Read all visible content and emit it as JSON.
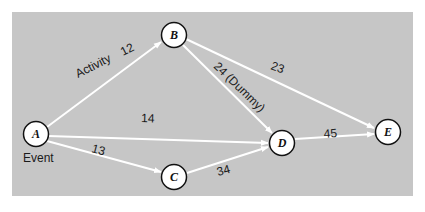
{
  "diagram": {
    "type": "network",
    "background": "#c6c6c6",
    "edge_color": "#ffffff",
    "nodes": [
      {
        "id": "A",
        "label": "A",
        "x": 36,
        "y": 134
      },
      {
        "id": "B",
        "label": "B",
        "x": 174,
        "y": 35
      },
      {
        "id": "C",
        "label": "C",
        "x": 174,
        "y": 177
      },
      {
        "id": "D",
        "label": "D",
        "x": 282,
        "y": 143
      },
      {
        "id": "E",
        "label": "E",
        "x": 388,
        "y": 132
      }
    ],
    "edges": [
      {
        "from": "A",
        "to": "B",
        "label": "12"
      },
      {
        "from": "A",
        "to": "D",
        "label": "14"
      },
      {
        "from": "A",
        "to": "C",
        "label": "13"
      },
      {
        "from": "B",
        "to": "E",
        "label": "23"
      },
      {
        "from": "B",
        "to": "D",
        "label": "24 (Dummy)"
      },
      {
        "from": "C",
        "to": "D",
        "label": "34"
      },
      {
        "from": "D",
        "to": "E",
        "label": "45"
      }
    ],
    "annotations": {
      "activity": "Activity",
      "event": "Event"
    }
  }
}
